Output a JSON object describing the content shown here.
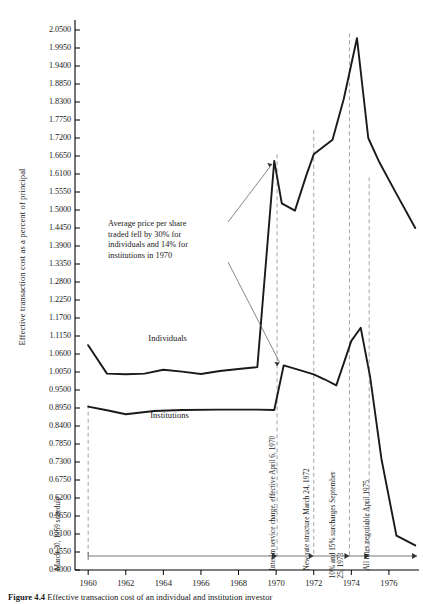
{
  "chart_data": {
    "type": "line",
    "title": "",
    "xlabel": "",
    "ylabel": "Effective transaction cost as a percent of principal",
    "xlim": [
      1959.3,
      1977.6
    ],
    "ylim": [
      0.4,
      2.05
    ],
    "grid": false,
    "legend": "inline-labels",
    "yticks": [
      "0.4000",
      "0.4550",
      "0.5100",
      "0.5650",
      "0.6200",
      "0.6750",
      "0.7300",
      "0.7850",
      "0.8400",
      "0.8950",
      "0.9500",
      "1.0050",
      "1.0600",
      "1.1150",
      "1.1700",
      "1.2250",
      "1.2800",
      "1.3350",
      "1.3900",
      "1.4450",
      "1.5000",
      "1.5550",
      "1.6100",
      "1.6650",
      "1.7200",
      "1.7750",
      "1.8300",
      "1.8850",
      "1.9400",
      "1.9950",
      "2.0500"
    ],
    "xticks": [
      "1960",
      "1962",
      "1964",
      "1966",
      "1968",
      "1970",
      "1972",
      "1974",
      "1976"
    ],
    "xtick_values": [
      1960,
      1962,
      1964,
      1966,
      1968,
      1970,
      1972,
      1974,
      1976
    ],
    "series": [
      {
        "name": "Individuals",
        "label_x": 1963.2,
        "label_y": 1.105,
        "x": [
          1960.0,
          1961.0,
          1962.0,
          1963.0,
          1964.0,
          1965.0,
          1966.0,
          1967.0,
          1968.0,
          1969.0,
          1969.9,
          1970.3,
          1971.0,
          1971.6,
          1972.0,
          1973.0,
          1973.6,
          1974.3,
          1974.9,
          1975.5,
          1976.3,
          1977.4
        ],
        "y": [
          1.087,
          1.0,
          0.998,
          1.0,
          1.012,
          1.006,
          0.999,
          1.008,
          1.014,
          1.02,
          1.65,
          1.52,
          1.498,
          1.605,
          1.67,
          1.715,
          1.84,
          2.025,
          1.72,
          1.645,
          1.56,
          1.445
        ]
      },
      {
        "name": "Institutions",
        "label_x": 1963.3,
        "label_y": 0.87,
        "x": [
          1960.0,
          1961.0,
          1962.0,
          1963.5,
          1965.0,
          1967.0,
          1969.0,
          1969.9,
          1970.4,
          1971.3,
          1972.0,
          1972.6,
          1973.2,
          1974.0,
          1974.5,
          1975.0,
          1975.6,
          1976.4,
          1977.4
        ],
        "y": [
          0.899,
          0.888,
          0.876,
          0.886,
          0.889,
          0.89,
          0.89,
          0.889,
          1.025,
          1.01,
          0.998,
          0.982,
          0.964,
          1.1,
          1.14,
          0.99,
          0.74,
          0.505,
          0.475
        ]
      }
    ],
    "annotation": {
      "text_lines": [
        "Average price per share",
        "traded fell by 30% for",
        "individuals and 14% for",
        "institutions in 1970"
      ],
      "text": "Average price per share traded fell by 30% for individuals and 14% for institutions in 1970"
    },
    "event_markers": [
      {
        "label": "March 30, 1959 schedule",
        "x": 1960.0
      },
      {
        "label": "Interim service charge, effective April 6, 1970",
        "x": 1970.05
      },
      {
        "label": "New rate structure March 24, 1972",
        "x": 1972.0
      },
      {
        "label_line1": "10% and 15% surcharges September",
        "label_line2": "25, 1973",
        "label": "10% and 15% surcharges September 25, 1973",
        "x": 1973.9
      },
      {
        "label": "All rates negotiable April 1975",
        "x": 1974.95
      }
    ],
    "regime_timeline": {
      "segments": [
        {
          "from": 1960.0,
          "to": 1970.05
        },
        {
          "from": 1970.05,
          "to": 1972.0
        },
        {
          "from": 1972.0,
          "to": 1973.9
        },
        {
          "from": 1973.9,
          "to": 1974.95
        },
        {
          "from": 1974.95,
          "to": 1977.5
        }
      ]
    }
  },
  "caption": {
    "figure_number": "Figure 4.4",
    "text": "Effective transaction cost of an individual and institution investor"
  },
  "colors": {
    "line": "#1a1a1a",
    "axis": "#000000",
    "dashed_marker": "#888888",
    "background": "#ffffff"
  }
}
